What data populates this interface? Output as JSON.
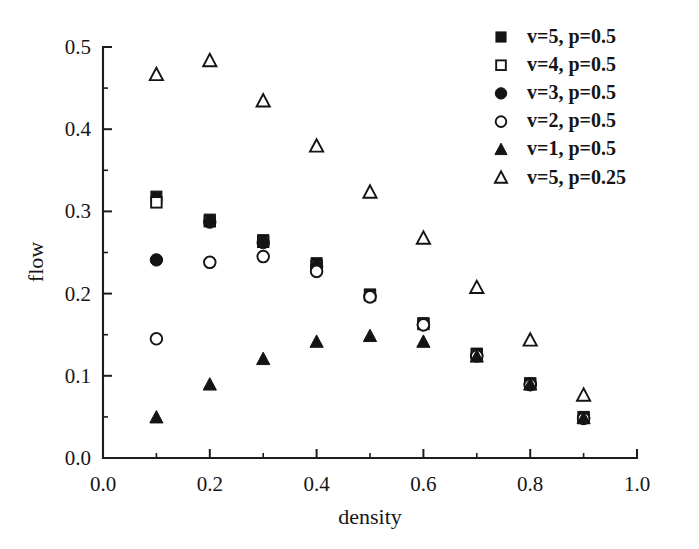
{
  "chart_data": {
    "type": "scatter",
    "title": "",
    "xlabel": "density",
    "ylabel": "flow",
    "xlim": [
      0.0,
      1.0
    ],
    "ylim": [
      0.0,
      0.5
    ],
    "grid": false,
    "legend_position": "top-right",
    "x_ticks": [
      "0.0",
      "0.2",
      "0.4",
      "0.6",
      "0.8",
      "1.0"
    ],
    "x_tick_values": [
      0.0,
      0.2,
      0.4,
      0.6,
      0.8,
      1.0
    ],
    "x_minor_ticks": [
      0.1,
      0.3,
      0.5,
      0.7,
      0.9
    ],
    "y_ticks": [
      "0.0",
      "0.1",
      "0.2",
      "0.3",
      "0.4",
      "0.5"
    ],
    "y_tick_values": [
      0.0,
      0.1,
      0.2,
      0.3,
      0.4,
      0.5
    ],
    "y_minor_ticks": [
      0.05,
      0.15,
      0.25,
      0.35,
      0.45
    ],
    "x": [
      0.1,
      0.2,
      0.3,
      0.4,
      0.5,
      0.6,
      0.7,
      0.8,
      0.9
    ],
    "series": [
      {
        "name": "v=5, p=0.5",
        "marker": "filled-square",
        "values": [
          0.318,
          0.29,
          0.265,
          0.237,
          0.199,
          0.164,
          0.127,
          0.091,
          0.05
        ]
      },
      {
        "name": "v=4, p=0.5",
        "marker": "open-square",
        "values": [
          0.311,
          0.288,
          0.263,
          0.234,
          0.198,
          0.163,
          0.126,
          0.09,
          0.049
        ]
      },
      {
        "name": "v=3, p=0.5",
        "marker": "filled-circle",
        "values": [
          0.241,
          0.287,
          0.262,
          0.233,
          0.197,
          0.162,
          0.125,
          0.09,
          0.049
        ]
      },
      {
        "name": "v=2, p=0.5",
        "marker": "open-circle",
        "values": [
          0.145,
          0.238,
          0.245,
          0.227,
          0.196,
          0.162,
          0.124,
          0.089,
          0.048
        ]
      },
      {
        "name": "v=1, p=0.5",
        "marker": "filled-triangle",
        "values": [
          0.049,
          0.089,
          0.12,
          0.141,
          0.148,
          0.141,
          0.123,
          0.089,
          0.048
        ]
      },
      {
        "name": "v=5, p=0.25",
        "marker": "open-triangle",
        "values": [
          0.466,
          0.483,
          0.434,
          0.379,
          0.323,
          0.267,
          0.207,
          0.143,
          0.076
        ]
      }
    ]
  },
  "legend": {
    "entries": [
      {
        "label": "v=5, p=0.5",
        "marker": "filled-square"
      },
      {
        "label": "v=4, p=0.5",
        "marker": "open-square"
      },
      {
        "label": "v=3, p=0.5",
        "marker": "filled-circle"
      },
      {
        "label": "v=2, p=0.5",
        "marker": "open-circle"
      },
      {
        "label": "v=1, p=0.5",
        "marker": "filled-triangle"
      },
      {
        "label": "v=5, p=0.25",
        "marker": "open-triangle"
      }
    ]
  },
  "colors": {
    "marker": "#141414",
    "axis": "#1d1d1d",
    "background": "#ffffff"
  }
}
